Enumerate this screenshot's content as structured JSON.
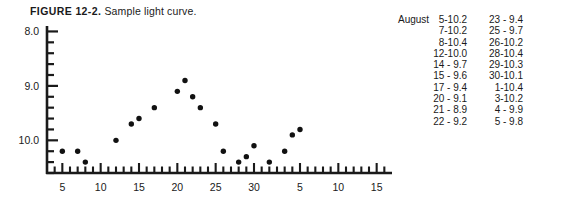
{
  "caption": {
    "figure_number": "FIGURE 12-2.",
    "text": "Sample light curve."
  },
  "chart_data": {
    "type": "scatter",
    "title": "Sample light curve.",
    "xlabel": "",
    "ylabel": "",
    "grid": false,
    "legend": null,
    "y_axis": {
      "major_ticks": [
        8.0,
        9.0,
        10.0
      ],
      "major_tick_labels": [
        "8.0",
        "9.0",
        "10.0"
      ],
      "minor_tick_interval": 0.2,
      "range": [
        10.6,
        7.9
      ],
      "inverted": true,
      "note": "magnitude axis, brighter (smaller) values upward"
    },
    "x_axis": {
      "major_tick_labels": [
        "5",
        "10",
        "15",
        "20",
        "25",
        "30",
        "5",
        "10",
        "15"
      ],
      "major_tick_values": [
        5,
        10,
        15,
        20,
        25,
        30,
        36,
        41,
        46
      ],
      "minor_tick_interval": 1,
      "range": [
        3,
        48
      ],
      "note": "August days 1-31 then September days 1-17"
    },
    "points": [
      {
        "x": 5,
        "y": 10.2,
        "label": "August 5"
      },
      {
        "x": 7,
        "y": 10.2,
        "label": "August 7"
      },
      {
        "x": 8,
        "y": 10.4,
        "label": "August 8"
      },
      {
        "x": 12,
        "y": 10.0,
        "label": "August 12"
      },
      {
        "x": 14,
        "y": 9.7,
        "label": "August 14"
      },
      {
        "x": 15,
        "y": 9.6,
        "label": "August 15"
      },
      {
        "x": 17,
        "y": 9.4,
        "label": "August 17"
      },
      {
        "x": 20,
        "y": 9.1,
        "label": "August 20"
      },
      {
        "x": 21,
        "y": 8.9,
        "label": "August 21"
      },
      {
        "x": 22,
        "y": 9.2,
        "label": "August 22"
      },
      {
        "x": 23,
        "y": 9.4,
        "label": "August 23"
      },
      {
        "x": 25,
        "y": 9.7,
        "label": "August 25"
      },
      {
        "x": 26,
        "y": 10.2,
        "label": "August 26"
      },
      {
        "x": 28,
        "y": 10.4,
        "label": "August 28"
      },
      {
        "x": 29,
        "y": 10.3,
        "label": "August 29"
      },
      {
        "x": 30,
        "y": 10.1,
        "label": "August 30"
      },
      {
        "x": 32,
        "y": 10.4,
        "label": "September 1"
      },
      {
        "x": 34,
        "y": 10.2,
        "label": "September 3"
      },
      {
        "x": 35,
        "y": 9.9,
        "label": "September 4"
      },
      {
        "x": 36,
        "y": 9.8,
        "label": "September 5"
      }
    ]
  },
  "table": {
    "month_label": "August",
    "column1": [
      {
        "day": "5",
        "dash": "-",
        "value": "10.2"
      },
      {
        "day": "7",
        "dash": "-",
        "value": "10.2"
      },
      {
        "day": "8",
        "dash": "-",
        "value": "10.4"
      },
      {
        "day": "12",
        "dash": "-",
        "value": "10.0"
      },
      {
        "day": "14",
        "dash": "-",
        "value": " 9.7"
      },
      {
        "day": "15",
        "dash": "-",
        "value": " 9.6"
      },
      {
        "day": "17",
        "dash": "-",
        "value": " 9.4"
      },
      {
        "day": "20",
        "dash": "-",
        "value": " 9.1"
      },
      {
        "day": "21",
        "dash": "-",
        "value": " 8.9"
      },
      {
        "day": "22",
        "dash": "-",
        "value": " 9.2"
      }
    ],
    "column2": [
      {
        "day": "23",
        "dash": "-",
        "value": " 9.4"
      },
      {
        "day": "25",
        "dash": "-",
        "value": " 9.7"
      },
      {
        "day": "26",
        "dash": "-",
        "value": "10.2"
      },
      {
        "day": "28",
        "dash": "-",
        "value": "10.4"
      },
      {
        "day": "29",
        "dash": "-",
        "value": "10.3"
      },
      {
        "day": "30",
        "dash": "-",
        "value": "10.1"
      },
      {
        "day": "1",
        "dash": "-",
        "value": "10.4"
      },
      {
        "day": "3",
        "dash": "-",
        "value": "10.2"
      },
      {
        "day": "4",
        "dash": "-",
        "value": " 9.9"
      },
      {
        "day": "5",
        "dash": "-",
        "value": " 9.8"
      }
    ]
  },
  "colors": {
    "ink": "#1a1a1a",
    "background": "#ffffff",
    "point": "#111111"
  }
}
